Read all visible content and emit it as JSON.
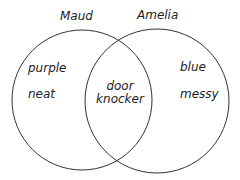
{
  "diagram": {
    "type": "venn",
    "sets": [
      {
        "name": "Maud",
        "items": [
          "purple",
          "neat"
        ]
      },
      {
        "name": "Amelia",
        "items": [
          "blue",
          "messy"
        ]
      }
    ],
    "intersection": {
      "line1": "door",
      "line2": "knocker"
    },
    "colors": {
      "stroke": "#333333",
      "text": "#222222",
      "background": "#ffffff"
    }
  }
}
